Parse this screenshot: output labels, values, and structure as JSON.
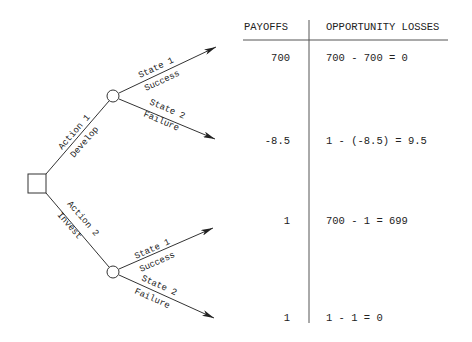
{
  "table": {
    "headers": {
      "payoffs": "PAYOFFS",
      "losses": "OPPORTUNITY LOSSES"
    },
    "rows": [
      {
        "payoff": "700",
        "loss": "700 - 700 = 0"
      },
      {
        "payoff": "-8.5",
        "loss": "1 - (-8.5) = 9.5"
      },
      {
        "payoff": "1",
        "loss": "700 - 1 = 699"
      },
      {
        "payoff": "1",
        "loss": "1 - 1 = 0"
      }
    ]
  },
  "tree": {
    "decision_node": "decision-square",
    "actions": [
      {
        "label": "Action 1",
        "name": "Develop",
        "states": [
          {
            "label": "State 1",
            "name": "Success"
          },
          {
            "label": "State 2",
            "name": "Failure"
          }
        ]
      },
      {
        "label": "Action 2",
        "name": "Invest",
        "states": [
          {
            "label": "State 1",
            "name": "Success"
          },
          {
            "label": "State 2",
            "name": "Failure"
          }
        ]
      }
    ]
  }
}
